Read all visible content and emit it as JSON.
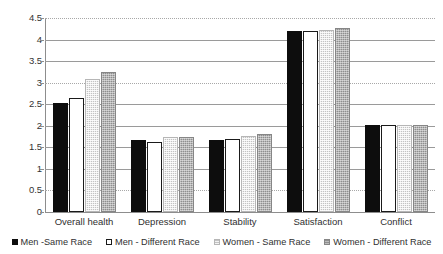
{
  "chart_data": {
    "type": "bar",
    "title": "",
    "subtitle": "",
    "xlabel": "",
    "ylabel": "",
    "ylim": [
      0,
      4.5
    ],
    "ytick_labels": [
      "4.5",
      "4",
      "3.5",
      "3",
      "2.5",
      "2",
      "1.5",
      "1",
      "0.5",
      "0"
    ],
    "ytick_values": [
      4.5,
      4,
      3.5,
      3,
      2.5,
      2,
      1.5,
      1,
      0.5,
      0
    ],
    "grid": true,
    "grid_axis": "y",
    "gridline_styles": [
      "dotted",
      "solid",
      "solid",
      "dotted",
      "solid",
      "solid",
      "solid",
      "solid",
      "dotted",
      "dotted"
    ],
    "legend_position": "bottom",
    "categories": [
      "Overall health",
      "Depression",
      "Stability",
      "Satisfaction",
      "Conflict"
    ],
    "series": [
      {
        "name": "Men -Same Race",
        "fill": "black",
        "color": "#0d0d0d",
        "values": [
          2.52,
          1.66,
          1.66,
          4.2,
          2.02
        ]
      },
      {
        "name": "Men - Different Race",
        "fill": "white-outlined",
        "color": "#ffffff",
        "values": [
          2.65,
          1.63,
          1.69,
          4.21,
          2.03
        ]
      },
      {
        "name": "Women - Same Race",
        "fill": "light-gray-texture",
        "color": "#c3c3c3",
        "values": [
          3.08,
          1.74,
          1.77,
          4.23,
          2.02
        ]
      },
      {
        "name": "Women - Different Race",
        "fill": "medium-gray-texture",
        "color": "#8f8f8f",
        "values": [
          3.25,
          1.73,
          1.82,
          4.28,
          2.02
        ]
      }
    ]
  }
}
